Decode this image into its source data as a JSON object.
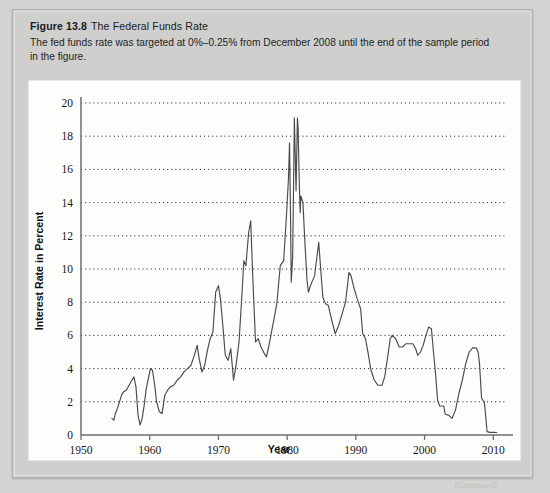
{
  "figure": {
    "label": "Figure 13.8",
    "title": "The Federal Funds Rate",
    "caption": "The fed funds rate was targeted at 0%–0.25% from December 2008 until the end of the sample period in the figure.",
    "footer_note": "(Continued)"
  },
  "colors": {
    "page_background": "#d4d4d2",
    "panel_background": "#cfcfcd",
    "plot_background": "#fdfdfc",
    "line": "#4a4a4a",
    "axis": "#6e6e6e",
    "gridline": "#2b2b2b",
    "text": "#1b1b1b"
  },
  "chart_data": {
    "type": "line",
    "title": "The Federal Funds Rate",
    "xlabel": "Year",
    "ylabel": "Interest Rate in Percent",
    "xlim": [
      1950,
      2012
    ],
    "ylim": [
      0,
      20
    ],
    "xticks": [
      1950,
      1960,
      1970,
      1980,
      1990,
      2000,
      2010
    ],
    "yticks": [
      0,
      2,
      4,
      6,
      8,
      10,
      12,
      14,
      16,
      18,
      20
    ],
    "grid": "horizontal-dotted",
    "legend": null,
    "series": [
      {
        "name": "Federal Funds Rate",
        "x": [
          1954.5,
          1954.8,
          1955.0,
          1955.3,
          1955.6,
          1955.9,
          1956.2,
          1956.6,
          1957.0,
          1957.4,
          1957.7,
          1958.0,
          1958.3,
          1958.6,
          1958.9,
          1959.2,
          1959.5,
          1959.8,
          1960.1,
          1960.4,
          1960.7,
          1961.0,
          1961.4,
          1961.8,
          1962.2,
          1962.6,
          1963.0,
          1963.5,
          1964.0,
          1964.5,
          1965.0,
          1965.5,
          1966.0,
          1966.5,
          1966.9,
          1967.2,
          1967.6,
          1968.0,
          1968.4,
          1968.8,
          1969.2,
          1969.6,
          1970.0,
          1970.3,
          1970.7,
          1971.0,
          1971.4,
          1971.8,
          1972.2,
          1972.6,
          1973.0,
          1973.4,
          1973.7,
          1974.0,
          1974.4,
          1974.7,
          1975.0,
          1975.4,
          1975.8,
          1976.2,
          1976.7,
          1977.0,
          1977.5,
          1978.0,
          1978.5,
          1979.0,
          1979.5,
          1979.9,
          1980.2,
          1980.35,
          1980.5,
          1980.6,
          1980.8,
          1980.95,
          1981.05,
          1981.2,
          1981.3,
          1981.4,
          1981.5,
          1981.6,
          1981.75,
          1981.9,
          1982.0,
          1982.3,
          1982.6,
          1982.9,
          1983.1,
          1983.4,
          1983.7,
          1984.0,
          1984.3,
          1984.6,
          1984.9,
          1985.2,
          1985.6,
          1986.0,
          1986.5,
          1987.0,
          1987.5,
          1988.0,
          1988.5,
          1989.0,
          1989.3,
          1989.7,
          1990.2,
          1990.7,
          1991.0,
          1991.4,
          1991.8,
          1992.2,
          1992.7,
          1993.2,
          1993.8,
          1994.2,
          1994.6,
          1995.0,
          1995.3,
          1995.8,
          1996.3,
          1996.8,
          1997.3,
          1997.8,
          1998.3,
          1998.7,
          1999.0,
          1999.4,
          1999.8,
          2000.2,
          2000.6,
          2001.0,
          2001.3,
          2001.6,
          2001.9,
          2002.2,
          2002.8,
          2003.0,
          2003.5,
          2004.0,
          2004.5,
          2005.0,
          2005.5,
          2006.0,
          2006.5,
          2007.0,
          2007.5,
          2007.8,
          2008.0,
          2008.3,
          2008.7,
          2008.95,
          2009.1,
          2009.5,
          2010.0,
          2010.5
        ],
        "y": [
          1.0,
          0.9,
          1.3,
          1.6,
          2.0,
          2.4,
          2.6,
          2.7,
          3.0,
          3.3,
          3.5,
          2.9,
          1.2,
          0.6,
          1.0,
          1.8,
          2.8,
          3.4,
          4.0,
          3.9,
          3.1,
          2.0,
          1.4,
          1.3,
          2.4,
          2.7,
          2.9,
          3.0,
          3.3,
          3.5,
          3.8,
          4.0,
          4.2,
          4.8,
          5.4,
          4.6,
          3.8,
          4.2,
          5.1,
          5.8,
          6.2,
          8.6,
          9.0,
          8.2,
          6.3,
          4.8,
          4.5,
          5.2,
          3.3,
          4.3,
          5.6,
          8.3,
          10.5,
          10.2,
          12.2,
          12.9,
          9.5,
          5.6,
          5.8,
          5.3,
          4.9,
          4.7,
          5.7,
          6.8,
          7.9,
          10.2,
          10.5,
          13.2,
          15.5,
          17.6,
          13.0,
          9.2,
          10.7,
          15.5,
          19.1,
          16.5,
          14.7,
          17.0,
          19.1,
          18.5,
          15.5,
          13.4,
          14.4,
          14.0,
          11.5,
          9.3,
          8.6,
          9.0,
          9.3,
          9.6,
          10.6,
          11.6,
          9.9,
          8.3,
          7.9,
          7.8,
          6.9,
          6.1,
          6.6,
          7.3,
          8.0,
          9.8,
          9.6,
          8.9,
          8.2,
          7.6,
          6.1,
          5.8,
          4.9,
          3.9,
          3.3,
          3.0,
          3.0,
          3.5,
          4.6,
          5.8,
          6.0,
          5.8,
          5.3,
          5.3,
          5.5,
          5.5,
          5.5,
          5.2,
          4.8,
          5.0,
          5.4,
          6.0,
          6.5,
          6.4,
          5.0,
          3.7,
          2.1,
          1.75,
          1.75,
          1.25,
          1.2,
          1.0,
          1.5,
          2.5,
          3.3,
          4.3,
          5.0,
          5.25,
          5.25,
          5.0,
          4.3,
          2.2,
          2.0,
          0.9,
          0.2,
          0.16,
          0.16,
          0.15
        ]
      }
    ]
  }
}
